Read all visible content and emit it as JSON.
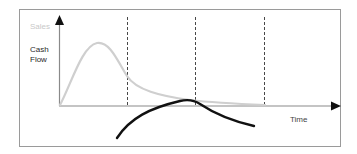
{
  "diagram": {
    "type": "lifecycle-curve",
    "labels": {
      "y_axis_series_1": "Sales",
      "y_axis_series_2_line1": "Cash",
      "y_axis_series_2_line2": "Flow",
      "x_axis": "Time"
    },
    "colors": {
      "frame": "#9a9a9a",
      "axes": "#8a8a8a",
      "arrow": "#111111",
      "sales_curve": "#cfcfcf",
      "cash_flow_curve": "#111111",
      "dashed_dividers": "#333333",
      "sales_label": "#c8c8c8"
    },
    "dashed_divider_count": 3
  }
}
